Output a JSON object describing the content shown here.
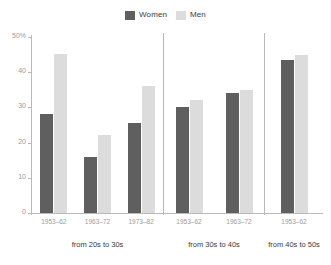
{
  "legend": {
    "position": "top-center",
    "entries": [
      {
        "label": "Women",
        "color": "#5f5f5f",
        "icon": "square-swatch-icon"
      },
      {
        "label": "Men",
        "color": "#dcdcdc",
        "icon": "square-swatch-icon"
      }
    ]
  },
  "chart_data": {
    "type": "bar",
    "title": "",
    "subtitle": "",
    "xlabel": "",
    "ylabel": "",
    "ylim": [
      0,
      50
    ],
    "grid": false,
    "legend_position": "top-center",
    "y_ticks": [
      {
        "value": 50,
        "label": "50%"
      },
      {
        "value": 40,
        "label": "40"
      },
      {
        "value": 30,
        "label": "30"
      },
      {
        "value": 20,
        "label": "20"
      },
      {
        "value": 10,
        "label": "10"
      },
      {
        "value": 0,
        "label": "0"
      }
    ],
    "series": [
      {
        "name": "Women",
        "color": "#5f5f5f"
      },
      {
        "name": "Men",
        "color": "#dcdcdc"
      }
    ],
    "panels": [
      {
        "label": "from 20s to 30s",
        "categories": [
          "1953–62",
          "1963–72",
          "1973–82"
        ],
        "values": {
          "Women": [
            28.0,
            16.0,
            25.5
          ],
          "Men": [
            45.3,
            22.3,
            36.0
          ]
        }
      },
      {
        "label": "from 30s to 40s",
        "categories": [
          "1953–62",
          "1963–72"
        ],
        "values": {
          "Women": [
            30.2,
            34.0
          ],
          "Men": [
            32.0,
            35.0
          ]
        }
      },
      {
        "label": "from 40s to 50s",
        "categories": [
          "1953–62"
        ],
        "values": {
          "Women": [
            43.6
          ],
          "Men": [
            44.9
          ]
        }
      }
    ]
  }
}
